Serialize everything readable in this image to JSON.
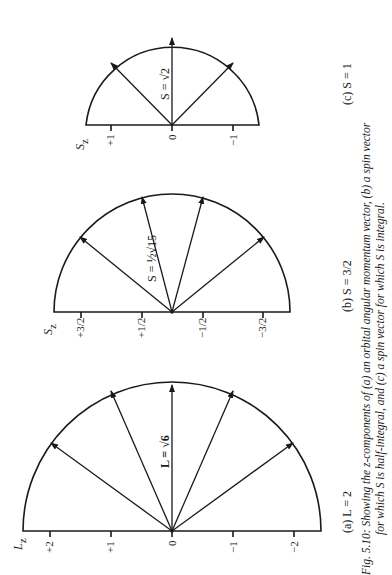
{
  "figure": {
    "caption_line1": "Fig. 5.10: Showing the z-components of (a) an orbital angular momentum vector, (b) a spin vector",
    "caption_line2": "for which S is half-integral, and (c) a spin vector for which S is integral.",
    "colors": {
      "ink": "#1a1a1a",
      "background": "#ffffff"
    }
  },
  "panels": [
    {
      "id": "a",
      "sublabel": "(a)  L = 2",
      "axis_label": "L_z",
      "axis_label_main": "L",
      "axis_label_sub": "z",
      "vector_label": "L = √6",
      "ticks": [
        "+2",
        "+1",
        "0",
        "−1",
        "−2"
      ],
      "z_values": [
        2,
        1,
        0,
        -1,
        -2
      ]
    },
    {
      "id": "b",
      "sublabel": "(b)  S = 3/2",
      "axis_label": "S_z",
      "axis_label_main": "S",
      "axis_label_sub": "z",
      "vector_label": "S = ½√15",
      "ticks": [
        "+3/2",
        "+1/2",
        "−1/2",
        "−3/2"
      ],
      "z_values": [
        1.5,
        0.5,
        -0.5,
        -1.5
      ]
    },
    {
      "id": "c",
      "sublabel": "(c)  S = 1",
      "axis_label": "S_z",
      "axis_label_main": "S",
      "axis_label_sub": "z",
      "vector_label": "S = √2",
      "ticks": [
        "+1",
        "0",
        "−1"
      ],
      "z_values": [
        1,
        0,
        -1
      ]
    }
  ]
}
